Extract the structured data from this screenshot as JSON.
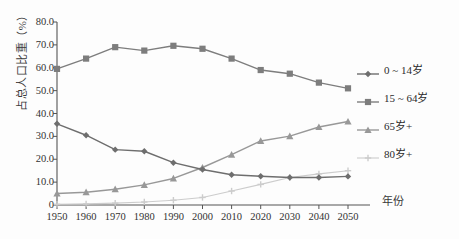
{
  "chart_data": {
    "type": "line",
    "title": "",
    "subtitle": "",
    "xlabel": "年份",
    "ylabel": "占总人口比重（%）",
    "x": [
      1950,
      1960,
      1970,
      1980,
      1990,
      2000,
      2010,
      2020,
      2030,
      2040,
      2050
    ],
    "categories": [
      "1950",
      "1960",
      "1970",
      "1980",
      "1990",
      "2000",
      "2010",
      "2020",
      "2030",
      "2040",
      "2050"
    ],
    "xlim": [
      1945,
      2055
    ],
    "ylim": [
      0,
      80
    ],
    "yticks": [
      0,
      10,
      20,
      30,
      40,
      50,
      60,
      70,
      80
    ],
    "ytick_labels": [
      "0",
      "10.0",
      "20.0",
      "30.0",
      "40.0",
      "50.0",
      "60.0",
      "70.0",
      "80.0"
    ],
    "grid": false,
    "legend_position": "right",
    "series": [
      {
        "name": "0 ~ 14岁",
        "marker": "diamond",
        "color": "#6e6e6e",
        "values": [
          35.5,
          30.5,
          24.2,
          23.5,
          18.5,
          15.5,
          13.2,
          12.6,
          12.0,
          12.0,
          12.5
        ]
      },
      {
        "name": "15 ~ 64岁",
        "marker": "square",
        "color": "#7d7d7d",
        "values": [
          59.5,
          64.0,
          69.0,
          67.5,
          69.6,
          68.3,
          64.0,
          59.0,
          57.4,
          53.5,
          51.0
        ]
      },
      {
        "name": "65岁+",
        "marker": "triangle",
        "color": "#989898",
        "values": [
          5.0,
          5.6,
          6.9,
          8.8,
          11.6,
          16.4,
          22.0,
          28.0,
          30.1,
          34.1,
          36.5
        ]
      },
      {
        "name": "80岁+",
        "marker": "cross",
        "color": "#cccccc",
        "values": [
          0.3,
          0.5,
          0.8,
          1.3,
          2.1,
          3.3,
          6.1,
          9.0,
          12.0,
          13.6,
          15.0
        ]
      }
    ]
  },
  "legend": {
    "items": [
      {
        "label": "0 ~ 14岁",
        "marker": "diamond",
        "color": "#6e6e6e"
      },
      {
        "label": "15 ~ 64岁",
        "marker": "square",
        "color": "#7d7d7d"
      },
      {
        "label": "65岁+",
        "marker": "triangle",
        "color": "#989898"
      },
      {
        "label": "80岁+",
        "marker": "cross",
        "color": "#cccccc"
      }
    ]
  },
  "axes": {
    "y_title": "占总人口比重（%）",
    "x_title": "年份",
    "y_tick_labels": [
      "80.0",
      "70.0",
      "60.0",
      "50.0",
      "40.0",
      "30.0",
      "20.0",
      "10.0",
      "0"
    ],
    "x_tick_labels": [
      "1950",
      "1960",
      "1970",
      "1980",
      "1990",
      "2000",
      "2010",
      "2020",
      "2030",
      "2040",
      "2050"
    ]
  }
}
